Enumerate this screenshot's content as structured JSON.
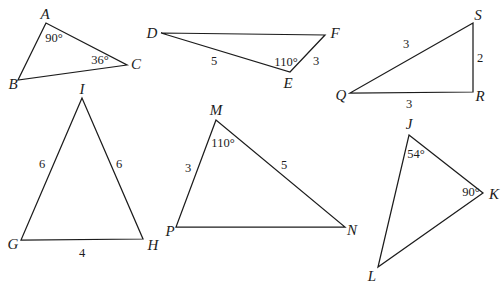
{
  "figure": {
    "background_color": "#ffffff",
    "line_color": "#1c1c1c",
    "text_color": "#1c1c1c",
    "triangles": [
      {
        "name": "ABC",
        "vertices": [
          [
            46,
            23
          ],
          [
            18,
            80
          ],
          [
            127,
            65
          ]
        ],
        "vertex_labels": [
          {
            "text": "A",
            "x": 45,
            "y": 14
          },
          {
            "text": "B",
            "x": 13,
            "y": 84
          },
          {
            "text": "C",
            "x": 136,
            "y": 64
          }
        ],
        "measure_labels": [
          {
            "text": "90°",
            "x": 54,
            "y": 38
          },
          {
            "text": "36°",
            "x": 100,
            "y": 60
          }
        ]
      },
      {
        "name": "DEF",
        "vertices": [
          [
            161,
            33
          ],
          [
            325,
            35
          ],
          [
            290,
            72
          ]
        ],
        "vertex_labels": [
          {
            "text": "D",
            "x": 152,
            "y": 33
          },
          {
            "text": "F",
            "x": 335,
            "y": 33
          },
          {
            "text": "E",
            "x": 288,
            "y": 83
          }
        ],
        "measure_labels": [
          {
            "text": "5",
            "x": 214,
            "y": 61
          },
          {
            "text": "110°",
            "x": 286,
            "y": 62
          },
          {
            "text": "3",
            "x": 316,
            "y": 61
          }
        ]
      },
      {
        "name": "QRS",
        "vertices": [
          [
            473,
            23
          ],
          [
            350,
            93
          ],
          [
            473,
            92
          ]
        ],
        "vertex_labels": [
          {
            "text": "S",
            "x": 478,
            "y": 15
          },
          {
            "text": "Q",
            "x": 341,
            "y": 95
          },
          {
            "text": "R",
            "x": 480,
            "y": 96
          }
        ],
        "measure_labels": [
          {
            "text": "3",
            "x": 406,
            "y": 44
          },
          {
            "text": "2",
            "x": 480,
            "y": 58
          },
          {
            "text": "3",
            "x": 409,
            "y": 104
          }
        ]
      },
      {
        "name": "GHI",
        "vertices": [
          [
            82,
            98
          ],
          [
            21,
            240
          ],
          [
            143,
            239
          ]
        ],
        "vertex_labels": [
          {
            "text": "I",
            "x": 82,
            "y": 89
          },
          {
            "text": "G",
            "x": 13,
            "y": 244
          },
          {
            "text": "H",
            "x": 153,
            "y": 245
          }
        ],
        "measure_labels": [
          {
            "text": "6",
            "x": 42,
            "y": 164
          },
          {
            "text": "6",
            "x": 119,
            "y": 164
          },
          {
            "text": "4",
            "x": 82,
            "y": 253
          }
        ]
      },
      {
        "name": "MPN",
        "vertices": [
          [
            216,
            120
          ],
          [
            176,
            227
          ],
          [
            345,
            227
          ]
        ],
        "vertex_labels": [
          {
            "text": "M",
            "x": 216,
            "y": 110
          },
          {
            "text": "P",
            "x": 170,
            "y": 231
          },
          {
            "text": "N",
            "x": 352,
            "y": 230
          }
        ],
        "measure_labels": [
          {
            "text": "110°",
            "x": 223,
            "y": 143
          },
          {
            "text": "3",
            "x": 188,
            "y": 168
          },
          {
            "text": "5",
            "x": 284,
            "y": 165
          }
        ]
      },
      {
        "name": "JKL",
        "vertices": [
          [
            409,
            135
          ],
          [
            483,
            193
          ],
          [
            378,
            267
          ]
        ],
        "vertex_labels": [
          {
            "text": "J",
            "x": 409,
            "y": 124
          },
          {
            "text": "K",
            "x": 494,
            "y": 194
          },
          {
            "text": "L",
            "x": 372,
            "y": 276
          }
        ],
        "measure_labels": [
          {
            "text": "54°",
            "x": 416,
            "y": 154
          },
          {
            "text": "90°",
            "x": 471,
            "y": 192
          }
        ]
      }
    ]
  }
}
